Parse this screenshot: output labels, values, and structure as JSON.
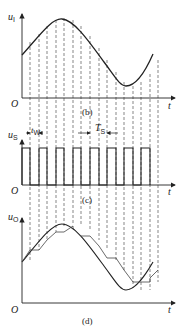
{
  "panels": [
    {
      "id": "b",
      "y_label": "u",
      "y_sub": "I",
      "caption": "(b)",
      "origin": "O",
      "x_label": "t"
    },
    {
      "id": "c",
      "y_label": "u",
      "y_sub": "S",
      "caption": "(c)",
      "origin": "O",
      "x_label": "t",
      "annotations": [
        {
          "label": "t",
          "sub": "W"
        },
        {
          "label": "T",
          "sub": "S"
        }
      ],
      "pulse_count": 8
    },
    {
      "id": "d",
      "y_label": "u",
      "y_sub": "O",
      "caption": "(d)",
      "origin": "O",
      "x_label": "t"
    }
  ],
  "colors": {
    "line": "#222222",
    "dash": "#555555"
  }
}
